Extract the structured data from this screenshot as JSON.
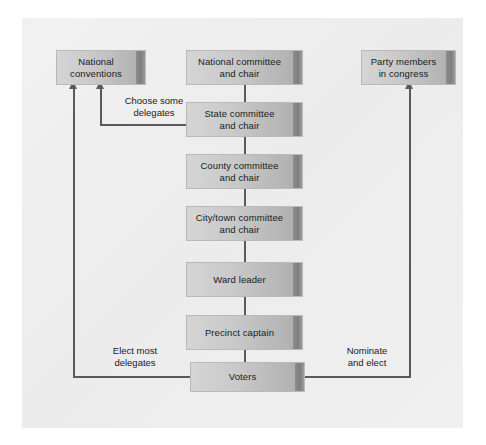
{
  "figure": {
    "type": "hierarchy-flow-diagram",
    "background_color": "#efefef",
    "node_fill_start": "#d5d5d5",
    "node_fill_end": "#a8a8a8",
    "connector_color": "#5a5a5a",
    "text_color": "#1a1a1a"
  },
  "nodes": {
    "national_conventions": {
      "label": "National\nconventions"
    },
    "national_committee": {
      "label": "National committee\nand chair"
    },
    "party_members_congress": {
      "label": "Party members\nin congress"
    },
    "state_committee": {
      "label": "State committee\nand chair"
    },
    "county_committee": {
      "label": "County committee\nand chair"
    },
    "city_town_committee": {
      "label": "City/town committee\nand chair"
    },
    "ward_leader": {
      "label": "Ward leader"
    },
    "precinct_captain": {
      "label": "Precinct captain"
    },
    "voters": {
      "label": "Voters"
    }
  },
  "edge_labels": {
    "choose_some_delegates": "Choose some\ndelegates",
    "elect_most_delegates": "Elect most\ndelegates",
    "nominate_and_elect": "Nominate\nand elect"
  }
}
